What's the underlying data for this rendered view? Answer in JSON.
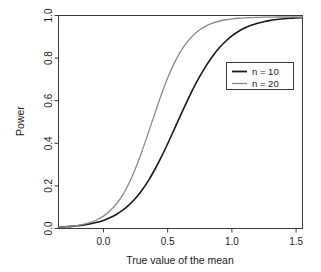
{
  "chart_data": {
    "type": "line",
    "title": "",
    "xlabel": "True value of the mean",
    "ylabel": "Power",
    "xlim": [
      -0.35,
      1.55
    ],
    "ylim": [
      0.0,
      1.0
    ],
    "grid": false,
    "legend_position": "upper right",
    "xticks": [
      0.0,
      0.5,
      1.0,
      1.5
    ],
    "xtick_labels": [
      "0.0",
      "0.5",
      "1.0",
      "1.5"
    ],
    "yticks": [
      0.0,
      0.2,
      0.4,
      0.6,
      0.8,
      1.0
    ],
    "ytick_labels": [
      "0.0",
      "0.2",
      "0.4",
      "0.6",
      "0.8",
      "1.0"
    ],
    "series": [
      {
        "name": "n = 10",
        "color": "#1a1a1a",
        "width": 1.6,
        "x": [
          -0.35,
          -0.3,
          -0.25,
          -0.2,
          -0.15,
          -0.1,
          -0.05,
          0.0,
          0.05,
          0.1,
          0.15,
          0.2,
          0.25,
          0.3,
          0.35,
          0.4,
          0.45,
          0.5,
          0.55,
          0.6,
          0.65,
          0.7,
          0.75,
          0.8,
          0.85,
          0.9,
          0.95,
          1.0,
          1.05,
          1.1,
          1.15,
          1.2,
          1.25,
          1.3,
          1.35,
          1.4,
          1.45,
          1.5,
          1.55
        ],
        "values": [
          0.006,
          0.008,
          0.01,
          0.013,
          0.017,
          0.022,
          0.029,
          0.038,
          0.05,
          0.066,
          0.086,
          0.111,
          0.142,
          0.18,
          0.225,
          0.277,
          0.335,
          0.398,
          0.464,
          0.531,
          0.596,
          0.658,
          0.714,
          0.765,
          0.809,
          0.847,
          0.878,
          0.904,
          0.925,
          0.941,
          0.954,
          0.964,
          0.971,
          0.977,
          0.981,
          0.985,
          0.987,
          0.989,
          0.99
        ]
      },
      {
        "name": "n = 20",
        "color": "#8a8a8a",
        "width": 1.3,
        "x": [
          -0.35,
          -0.3,
          -0.25,
          -0.2,
          -0.15,
          -0.1,
          -0.05,
          0.0,
          0.05,
          0.1,
          0.15,
          0.2,
          0.25,
          0.3,
          0.35,
          0.4,
          0.45,
          0.5,
          0.55,
          0.6,
          0.65,
          0.7,
          0.75,
          0.8,
          0.85,
          0.9,
          0.95,
          1.0,
          1.05,
          1.1,
          1.15,
          1.2,
          1.25,
          1.3,
          1.35,
          1.4,
          1.45,
          1.5,
          1.55
        ],
        "values": [
          0.006,
          0.008,
          0.011,
          0.015,
          0.021,
          0.029,
          0.041,
          0.058,
          0.082,
          0.115,
          0.158,
          0.214,
          0.283,
          0.363,
          0.45,
          0.54,
          0.627,
          0.706,
          0.774,
          0.83,
          0.874,
          0.908,
          0.933,
          0.951,
          0.964,
          0.973,
          0.98,
          0.984,
          0.987,
          0.989,
          0.99,
          0.991,
          0.992,
          0.992,
          0.993,
          0.993,
          0.993,
          0.993,
          0.993
        ]
      }
    ],
    "legend": [
      {
        "label": "n = 10",
        "color": "#1a1a1a",
        "width": 1.8
      },
      {
        "label": "n = 20",
        "color": "#8a8a8a",
        "width": 1.3
      }
    ]
  }
}
